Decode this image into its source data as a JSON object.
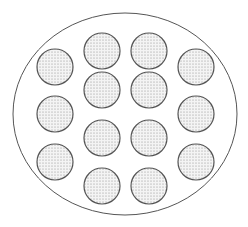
{
  "diagram": {
    "colors": {
      "background": "#ffffff",
      "outline": "#555555",
      "stipple": "#8a8a8a",
      "circle_fill": "#f4f4f4"
    },
    "outer_ellipse": {
      "cx": 125,
      "cy": 114,
      "rx": 112,
      "ry": 101
    },
    "circle_radius": 18,
    "circles": [
      {
        "id": "top-left-inner",
        "cx": 102,
        "cy": 51
      },
      {
        "id": "top-right-inner",
        "cx": 149,
        "cy": 51
      },
      {
        "id": "left-upper",
        "cx": 55,
        "cy": 67
      },
      {
        "id": "right-upper",
        "cx": 196,
        "cy": 67
      },
      {
        "id": "inner-upper-left",
        "cx": 102,
        "cy": 90
      },
      {
        "id": "inner-upper-right",
        "cx": 149,
        "cy": 90
      },
      {
        "id": "left-middle",
        "cx": 55,
        "cy": 114
      },
      {
        "id": "right-middle",
        "cx": 196,
        "cy": 114
      },
      {
        "id": "inner-lower-left",
        "cx": 102,
        "cy": 138
      },
      {
        "id": "inner-lower-right",
        "cx": 149,
        "cy": 138
      },
      {
        "id": "left-lower",
        "cx": 55,
        "cy": 162
      },
      {
        "id": "right-lower",
        "cx": 196,
        "cy": 162
      },
      {
        "id": "bottom-left-inner",
        "cx": 102,
        "cy": 186
      },
      {
        "id": "bottom-right-inner",
        "cx": 149,
        "cy": 186
      }
    ]
  }
}
